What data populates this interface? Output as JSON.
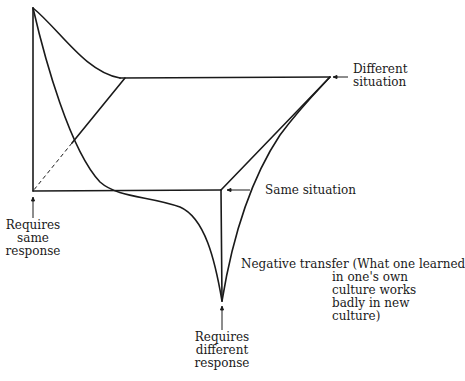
{
  "diagram": {
    "type": "3d-transfer-surface",
    "colors": {
      "line": "#1a1a1a",
      "background": "#ffffff"
    },
    "labels": {
      "different_situation": [
        "Different",
        "situation"
      ],
      "same_situation": "Same situation",
      "requires_same_response": [
        "Requires",
        "same",
        "response"
      ],
      "requires_different_response": [
        "Requires",
        "different",
        "response"
      ],
      "negative_transfer": {
        "title": "Negative transfer",
        "lines": [
          "(What one learned",
          "in one's own",
          "culture works",
          "badly in new",
          "culture)"
        ]
      }
    }
  }
}
